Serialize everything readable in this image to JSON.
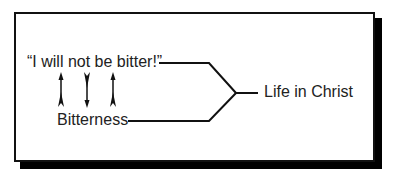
{
  "diagram": {
    "type": "flow",
    "nodes": [
      {
        "id": "quote",
        "label": "“I will not be bitter!”"
      },
      {
        "id": "bitterness",
        "label": "Bitterness"
      },
      {
        "id": "life",
        "label": "Life in Christ"
      }
    ],
    "edges": [
      {
        "from": "quote",
        "to": "life",
        "style": "bracket-merge"
      },
      {
        "from": "bitterness",
        "to": "life",
        "style": "bracket-merge"
      },
      {
        "from": "bitterness",
        "to": "quote",
        "style": "arrow-up"
      },
      {
        "from": "quote",
        "to": "bitterness",
        "style": "arrow-down"
      },
      {
        "from": "bitterness",
        "to": "quote",
        "style": "arrow-up"
      }
    ],
    "arrows": [
      {
        "direction": "up"
      },
      {
        "direction": "down"
      },
      {
        "direction": "up"
      }
    ]
  },
  "colors": {
    "ink": "#111111",
    "text": "#222222",
    "shadow": "#000000",
    "background": "#ffffff"
  }
}
